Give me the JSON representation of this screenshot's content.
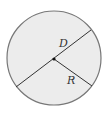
{
  "diagram": {
    "type": "circle",
    "labels": {
      "diameter": "D",
      "radius": "R"
    },
    "colors": {
      "fill": "#ececec",
      "stroke": "#777777",
      "line": "#333333",
      "center_dot": "#111111"
    }
  }
}
